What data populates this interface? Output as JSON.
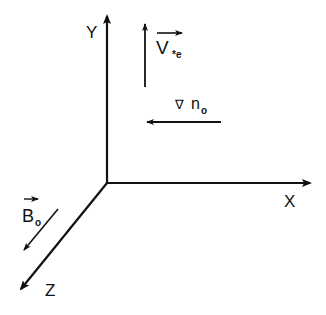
{
  "diagram": {
    "axes": {
      "x": {
        "label": "X"
      },
      "y": {
        "label": "Y"
      },
      "z": {
        "label": "Z"
      }
    },
    "vectors": {
      "drift_velocity": {
        "symbol": "V",
        "subscript": "*e",
        "direction": "+Y"
      },
      "density_gradient": {
        "symbol": "∇",
        "variable": "n",
        "subscript": "o",
        "direction": "-X"
      },
      "magnetic_field": {
        "symbol": "B",
        "subscript": "o",
        "direction": "+Z"
      }
    },
    "colors": {
      "ink": "#111111",
      "background": "#ffffff"
    }
  }
}
